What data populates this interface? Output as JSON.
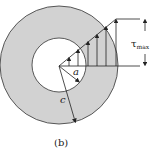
{
  "figure": {
    "caption": "(b)",
    "labels": {
      "tau": "τ",
      "tau_sub": "max",
      "inner_radius": "a",
      "outer_radius": "c"
    },
    "colors": {
      "section_fill": "#d2d2d2",
      "line": "#222222",
      "background": "#ffffff"
    },
    "geometry": {
      "center": [
        59,
        65
      ],
      "outer_radius": 59,
      "inner_radius": 27
    },
    "arrows_x": [
      69,
      78,
      88,
      97,
      106,
      116
    ]
  }
}
